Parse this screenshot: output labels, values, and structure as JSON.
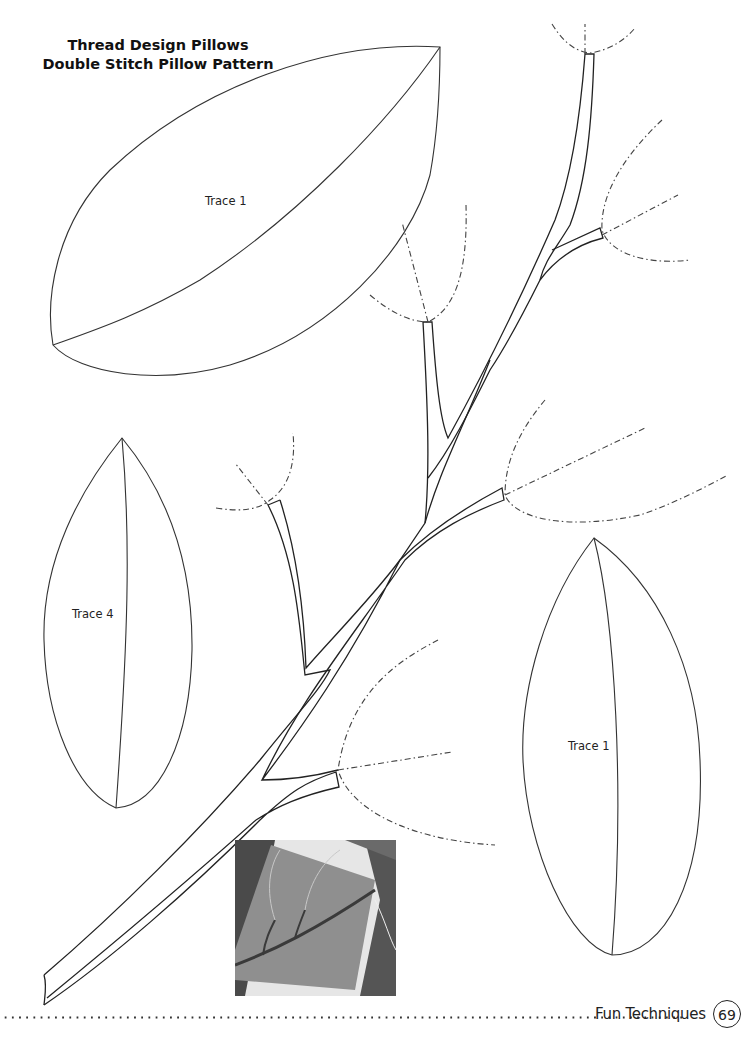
{
  "header": {
    "title_line1": "Thread Design Pillows",
    "title_line2": "Double Stitch Pillow Pattern"
  },
  "templates": [
    {
      "id": "leaf-large-top",
      "label": "Trace 1"
    },
    {
      "id": "leaf-left",
      "label": "Trace 4"
    },
    {
      "id": "leaf-right",
      "label": "Trace 1"
    }
  ],
  "illustration": {
    "branch": "branch-stem-pattern",
    "stitch_lines": "dash-dot stitching guides",
    "photo": "quilted-pillow-sample-photo"
  },
  "footer": {
    "section": "Fun Techniques",
    "page_number": "69"
  },
  "colors": {
    "ink": "#222222",
    "background": "#ffffff"
  }
}
